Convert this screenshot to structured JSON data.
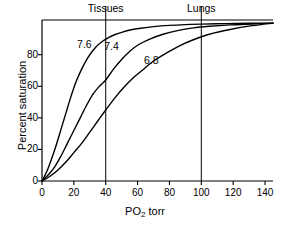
{
  "chart_data": {
    "type": "line",
    "title": "",
    "xlabel": "PO2 torr",
    "xlabel_base": "PO",
    "xlabel_sub": "2",
    "xlabel_unit": " torr",
    "ylabel": "Percent saturation",
    "xlim": [
      0,
      145
    ],
    "ylim": [
      0,
      102
    ],
    "grid": false,
    "legend": "inline curve labels",
    "xticks": [
      0,
      20,
      40,
      60,
      80,
      100,
      120,
      140
    ],
    "xtick_labels": [
      "0",
      "20",
      "40",
      "60",
      "80",
      "100",
      "120",
      "140"
    ],
    "yticks": [
      0,
      20,
      40,
      60,
      80
    ],
    "ytick_labels": [
      "0",
      "20",
      "40",
      "60",
      "80"
    ],
    "series": [
      {
        "name": "7.6",
        "label": "7.6",
        "label_x": 22,
        "label_y": 86,
        "color": "#000000",
        "x": [
          0,
          3,
          6,
          9,
          12,
          15,
          18,
          21,
          24,
          27,
          30,
          34,
          38,
          42,
          46,
          50,
          56,
          62,
          70,
          80,
          90,
          100,
          115,
          130,
          145
        ],
        "y": [
          0,
          6,
          14,
          23,
          33,
          43,
          53,
          62,
          69,
          75,
          80,
          85,
          88.5,
          91,
          92.8,
          94.2,
          95.8,
          96.8,
          97.8,
          98.6,
          99.1,
          99.4,
          99.7,
          99.9,
          100
        ]
      },
      {
        "name": "7.4",
        "label": "7.4",
        "label_x": 39,
        "label_y": 85,
        "color": "#000000",
        "x": [
          0,
          4,
          8,
          12,
          16,
          20,
          24,
          28,
          32,
          36,
          40,
          45,
          50,
          55,
          60,
          68,
          76,
          85,
          95,
          105,
          118,
          132,
          145
        ],
        "y": [
          0,
          4,
          9,
          16,
          24,
          32,
          40,
          48,
          55,
          60,
          64,
          71,
          77,
          82,
          86,
          90,
          93,
          95.3,
          97,
          98,
          98.9,
          99.5,
          100
        ]
      },
      {
        "name": "6.8",
        "label": "6.8",
        "label_x": 64,
        "label_y": 76,
        "color": "#000000",
        "x": [
          0,
          5,
          10,
          15,
          20,
          25,
          30,
          35,
          40,
          46,
          52,
          58,
          64,
          70,
          78,
          86,
          95,
          105,
          118,
          132,
          145
        ],
        "y": [
          0,
          3,
          7,
          12,
          18,
          24,
          31,
          38,
          45,
          53,
          60,
          66,
          71,
          76,
          81,
          85.5,
          89.5,
          93,
          96,
          98.4,
          100
        ]
      }
    ],
    "vertical_markers": [
      {
        "label": "Tissues",
        "x": 40
      },
      {
        "label": "Lungs",
        "x": 100
      }
    ]
  }
}
